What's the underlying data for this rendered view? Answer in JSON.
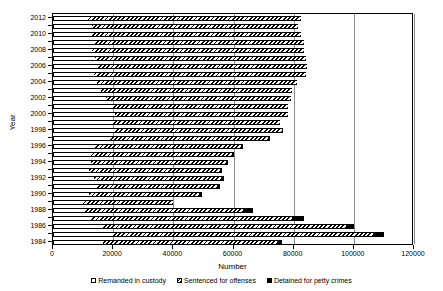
{
  "chart_data": {
    "type": "bar",
    "orientation": "horizontal",
    "stacked": true,
    "title": "",
    "xlabel": "Number",
    "ylabel": "Year",
    "xlim": [
      0,
      120000
    ],
    "xticks": [
      0,
      20000,
      40000,
      60000,
      80000,
      100000,
      120000
    ],
    "xtick_labels": [
      "0",
      "20000",
      "40000",
      "60000",
      "80000",
      "100000",
      "120000"
    ],
    "grid": true,
    "grid_axis": "x",
    "legend_position": "bottom",
    "categories": [
      2012,
      2011,
      2010,
      2009,
      2008,
      2007,
      2006,
      2005,
      2004,
      2003,
      2002,
      2001,
      2000,
      1999,
      1998,
      1997,
      1996,
      1995,
      1994,
      1993,
      1992,
      1991,
      1990,
      1989,
      1988,
      1987,
      1986,
      1985,
      1984
    ],
    "ytick_labels": [
      "2012",
      "2010",
      "2008",
      "2006",
      "2004",
      "2002",
      "2000",
      "1998",
      "1996",
      "1994",
      "1992",
      "1990",
      "1988",
      "1986",
      "1984"
    ],
    "series": [
      {
        "name": "Remanded in custody",
        "values": [
          11500,
          13000,
          12500,
          13500,
          13000,
          14000,
          15000,
          13500,
          14500,
          16000,
          17500,
          19500,
          20500,
          20000,
          20500,
          19000,
          14000,
          12500,
          12500,
          12000,
          13500,
          14500,
          12000,
          9500,
          10500,
          12500,
          16500,
          19500,
          16500
        ]
      },
      {
        "name": "Sentenced for offenses",
        "values": [
          71000,
          68500,
          70000,
          70000,
          70500,
          70000,
          69500,
          70500,
          66500,
          63500,
          61500,
          58500,
          57500,
          55500,
          55500,
          52500,
          48500,
          47000,
          45000,
          43500,
          42500,
          40000,
          36500,
          30500,
          52500,
          67000,
          81000,
          87000,
          58000
        ]
      },
      {
        "name": "Detained for petty crimes",
        "values": [
          0,
          0,
          0,
          0,
          0,
          0,
          0,
          0,
          0,
          0,
          0,
          0,
          0,
          0,
          500,
          500,
          700,
          800,
          700,
          700,
          900,
          900,
          900,
          0,
          3500,
          4000,
          2500,
          3500,
          1500
        ]
      }
    ]
  },
  "legend": {
    "items": [
      {
        "label": "Remanded in custody",
        "key": "open-square-marker"
      },
      {
        "label": "Sentenced for offenses",
        "key": "hatched-square-marker"
      },
      {
        "label": "Detained for petty crimes",
        "key": "filled-square-marker"
      }
    ]
  },
  "colors": {
    "bar_outline": "#000000",
    "remanded_fill": "#ffffff",
    "sentenced_fill": "#000000",
    "petty_fill": "#000000",
    "gridline": "#8c8c8c",
    "background": "#ffffff"
  }
}
